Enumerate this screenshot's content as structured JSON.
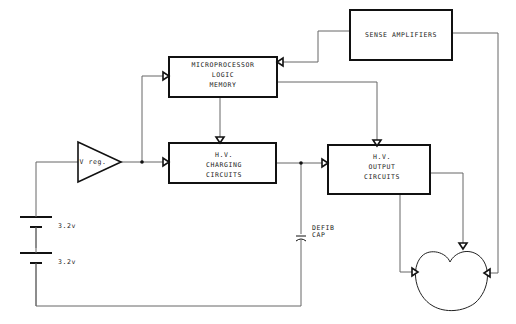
{
  "diagram": {
    "blocks": {
      "sense_amplifiers": {
        "label": "SENSE AMPLIFIERS"
      },
      "microprocessor": {
        "lines": [
          "MICROPROCESSOR",
          "LOGIC",
          "MEMORY"
        ]
      },
      "v_reg": {
        "label": "V reg."
      },
      "hv_charging": {
        "lines": [
          "H.V.",
          "CHARGING",
          "CIRCUITS"
        ]
      },
      "hv_output": {
        "lines": [
          "H.V.",
          "OUTPUT",
          "CIRCUITS"
        ]
      },
      "heart": {
        "label": ""
      }
    },
    "batteries": [
      {
        "label": "3.2v"
      },
      {
        "label": "3.2v"
      }
    ],
    "capacitor": {
      "lines": [
        "DEFIB",
        "CAP"
      ]
    },
    "colors": {
      "line": "#111111",
      "wire": "#666666",
      "background": "#ffffff"
    }
  }
}
